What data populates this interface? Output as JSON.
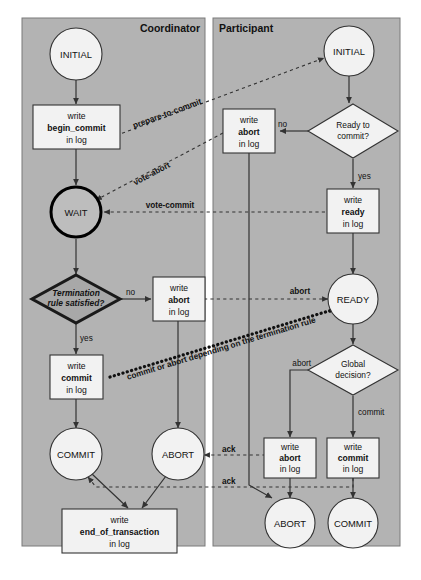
{
  "figure": {
    "colors": {
      "panel_fill": "#b3b3b3",
      "node_fill": "#f2f2f2",
      "wait_fill": "#bdbdbd",
      "termination_fill": "#a8a8a8",
      "stroke": "#333333",
      "background": "#ffffff"
    }
  },
  "panels": [
    {
      "id": "coordinator",
      "label": "Coordinator"
    },
    {
      "id": "participant",
      "label": "Participant"
    }
  ],
  "coordinator": {
    "nodes": [
      {
        "id": "c-initial",
        "type": "circle",
        "label": "INITIAL"
      },
      {
        "id": "c-begin-commit",
        "type": "box",
        "line1": "write",
        "line2": "begin_commit",
        "line3": "in log"
      },
      {
        "id": "c-wait",
        "type": "circle-bold",
        "label": "WAIT"
      },
      {
        "id": "c-termination",
        "type": "diamond-dark",
        "line1": "Termination",
        "line2": "rule satisfied?"
      },
      {
        "id": "c-abort-log",
        "type": "box",
        "line1": "write",
        "line2": "abort",
        "line3": "in log"
      },
      {
        "id": "c-commit-log",
        "type": "box",
        "line1": "write",
        "line2": "commit",
        "line3": "in log"
      },
      {
        "id": "c-commit",
        "type": "circle",
        "label": "COMMIT"
      },
      {
        "id": "c-abort",
        "type": "circle",
        "label": "ABORT"
      },
      {
        "id": "c-end-of-transaction",
        "type": "box",
        "line1": "write",
        "line2": "end_of_transaction",
        "line3": "in log"
      }
    ],
    "edge_labels": {
      "termination_no": "no",
      "termination_yes": "yes"
    }
  },
  "participant": {
    "nodes": [
      {
        "id": "p-initial",
        "type": "circle",
        "label": "INITIAL"
      },
      {
        "id": "p-ready-q",
        "type": "diamond",
        "line1": "Ready to",
        "line2": "commit?"
      },
      {
        "id": "p-abort-log-top",
        "type": "box",
        "line1": "write",
        "line2": "abort",
        "line3": "in log"
      },
      {
        "id": "p-ready-log",
        "type": "box",
        "line1": "write",
        "line2": "ready",
        "line3": "in log"
      },
      {
        "id": "p-ready",
        "type": "circle",
        "label": "READY"
      },
      {
        "id": "p-global-q",
        "type": "diamond",
        "line1": "Global",
        "line2": "decision?"
      },
      {
        "id": "p-abort-log-bottom",
        "type": "box",
        "line1": "write",
        "line2": "abort",
        "line3": "in log"
      },
      {
        "id": "p-commit-log",
        "type": "box",
        "line1": "write",
        "line2": "commit",
        "line3": "in log"
      },
      {
        "id": "p-abort",
        "type": "circle",
        "label": "ABORT"
      },
      {
        "id": "p-commit",
        "type": "circle",
        "label": "COMMIT"
      }
    ],
    "edge_labels": {
      "ready_no": "no",
      "ready_yes": "yes",
      "global_abort": "abort",
      "global_commit": "commit"
    }
  },
  "messages": [
    {
      "id": "msg-prepare-to-commit",
      "label": "prepare-to-commit",
      "style": "dashed-rotated"
    },
    {
      "id": "msg-vote-abort",
      "label": "vote-abort",
      "style": "dashed-rotated"
    },
    {
      "id": "msg-vote-commit",
      "label": "vote-commit",
      "style": "dashed-horizontal"
    },
    {
      "id": "msg-abort",
      "label": "abort",
      "style": "dashed-horizontal"
    },
    {
      "id": "msg-commit-or-abort",
      "label": "commit or abort depending on the termination rule",
      "style": "dotted-thick-rotated"
    },
    {
      "id": "msg-ack-1",
      "label": "ack",
      "style": "dashed-horizontal"
    },
    {
      "id": "msg-ack-2",
      "label": "ack",
      "style": "dashed-horizontal"
    }
  ]
}
